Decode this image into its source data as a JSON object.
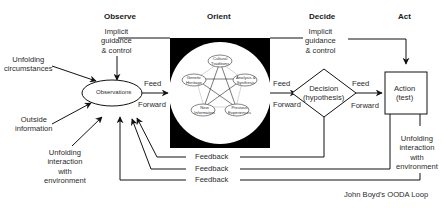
{
  "diagram": {
    "caption": "John Boyd's OODA Loop",
    "phases": {
      "observe": "Observe",
      "orient": "Orient",
      "decide": "Decide",
      "act": "Act"
    },
    "implicit_guidance": {
      "line1": "Implicit",
      "line2": "guidance",
      "line3": "& control"
    },
    "inputs": {
      "unfolding_circumstances": [
        "Unfolding",
        "circumstances"
      ],
      "outside_information": [
        "Outside",
        "information"
      ],
      "unfolding_interaction": [
        "Unfolding",
        "interaction",
        "with",
        "environment"
      ]
    },
    "nodes": {
      "observations": "Observations",
      "decision": [
        "Decision",
        "(hypothesis)"
      ],
      "action": [
        "Action",
        "(test)"
      ]
    },
    "orient_factors": [
      [
        "Cultural",
        "Traditions"
      ],
      [
        "Analysis &",
        "Synthesis"
      ],
      [
        "Previous",
        "Experiences"
      ],
      [
        "New",
        "Information"
      ],
      [
        "Genetic",
        "Heritage"
      ]
    ],
    "feed_forward": {
      "line1": "Feed",
      "line2": "Forward"
    },
    "feedback_label": "Feedback",
    "act_output": [
      "Unfolding",
      "interaction",
      "with",
      "environment"
    ],
    "colors": {
      "ink": "#1a1a1a",
      "orient_bg": "#000000",
      "orient_circle": "#ffffff"
    }
  }
}
